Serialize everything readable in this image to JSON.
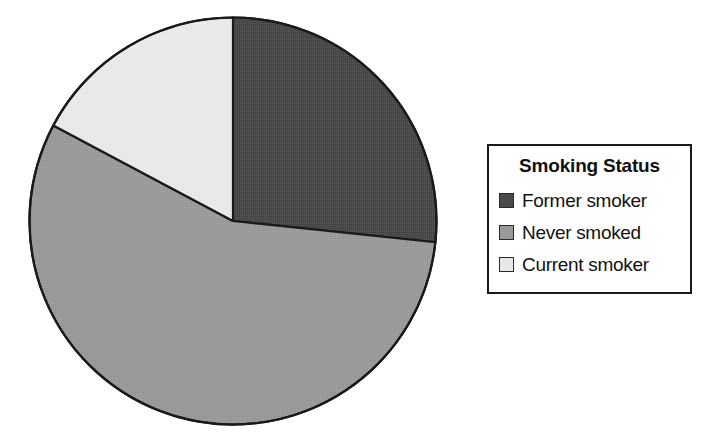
{
  "chart_data": {
    "type": "pie",
    "title": "",
    "legend_title": "Smoking Status",
    "legend_position": "right",
    "categories": [
      "Former smoker",
      "Never smoked",
      "Current smoker"
    ],
    "values": [
      26.7,
      56.1,
      17.2
    ],
    "value_unit": "percent",
    "start_angle_deg": 0,
    "direction": "clockwise",
    "slices": [
      {
        "label": "Former smoker",
        "value": 26.7,
        "color": "#4a4a4a",
        "start_angle_deg": 0,
        "end_angle_deg": 96
      },
      {
        "label": "Never smoked",
        "value": 56.1,
        "color": "#9a9a9a",
        "start_angle_deg": 96,
        "end_angle_deg": 298
      },
      {
        "label": "Current smoker",
        "value": 17.2,
        "color": "#e8e8e8",
        "start_angle_deg": 298,
        "end_angle_deg": 360
      }
    ],
    "xlabel": "",
    "ylabel": "",
    "grid": false,
    "outline_color": "#1a1a1a",
    "background": "#ffffff"
  },
  "legend": {
    "title": "Smoking Status",
    "items": [
      {
        "label": "Former smoker",
        "color": "#4a4a4a"
      },
      {
        "label": "Never smoked",
        "color": "#9a9a9a"
      },
      {
        "label": "Current smoker",
        "color": "#e8e8e8"
      }
    ]
  }
}
